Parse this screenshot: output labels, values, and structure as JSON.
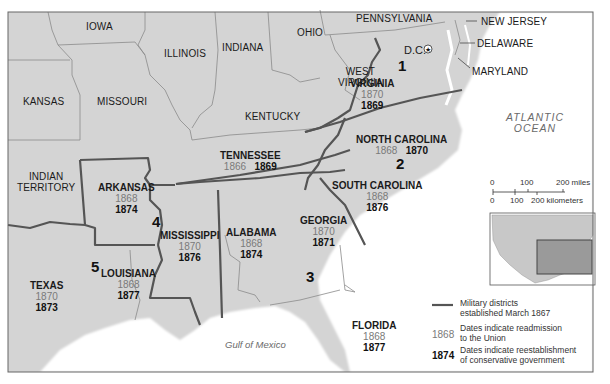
{
  "map": {
    "ocean_label": [
      "ATLANTIC",
      "OCEAN"
    ],
    "gulf_label": "Gulf of Mexico",
    "colors": {
      "land": "#d4d4d4",
      "water": "#ffffff",
      "district_border": "#555555",
      "state_border": "#8a8a8a",
      "readmission_text": "#7a7a7a",
      "reestablishment_text": "#111111"
    },
    "other_states": {
      "iowa": "IOWA",
      "illinois": "ILLINOIS",
      "indiana": "INDIANA",
      "ohio": "OHIO",
      "pennsylvania": "PENNSYLVANIA",
      "new_jersey": "NEW JERSEY",
      "delaware": "DELAWARE",
      "maryland": "MARYLAND",
      "dc": "D.C.",
      "west_virginia": [
        "WEST",
        "VIRGINIA"
      ],
      "kansas": "KANSAS",
      "missouri": "MISSOURI",
      "kentucky": "KENTUCKY",
      "indian_territory": [
        "INDIAN",
        "TERRITORY"
      ]
    },
    "confederate_states": {
      "virginia": {
        "name": "VIRGINIA",
        "readmission": "1870",
        "reestablishment": "1869"
      },
      "north_carolina": {
        "name": "NORTH CAROLINA",
        "readmission": "1868",
        "reestablishment": "1870"
      },
      "south_carolina": {
        "name": "SOUTH CAROLINA",
        "readmission": "1868",
        "reestablishment": "1876"
      },
      "tennessee": {
        "name": "TENNESSEE",
        "readmission": "1866",
        "reestablishment": "1869"
      },
      "georgia": {
        "name": "GEORGIA",
        "readmission": "1870",
        "reestablishment": "1871"
      },
      "alabama": {
        "name": "ALABAMA",
        "readmission": "1868",
        "reestablishment": "1874"
      },
      "mississippi": {
        "name": "MISSISSIPPI",
        "readmission": "1870",
        "reestablishment": "1876"
      },
      "arkansas": {
        "name": "ARKANSAS",
        "readmission": "1868",
        "reestablishment": "1874"
      },
      "louisiana": {
        "name": "LOUISIANA",
        "readmission": "1868",
        "reestablishment": "1877"
      },
      "texas": {
        "name": "TEXAS",
        "readmission": "1870",
        "reestablishment": "1873"
      },
      "florida": {
        "name": "FLORIDA",
        "readmission": "1868",
        "reestablishment": "1877"
      }
    },
    "military_districts": [
      "1",
      "2",
      "3",
      "4",
      "5"
    ]
  },
  "scale": {
    "miles": [
      "0",
      "100",
      "200 miles"
    ],
    "kilometers": [
      "0",
      "100",
      "200 kilometers"
    ]
  },
  "legend": {
    "districts_line": [
      "Military districts",
      "established March 1867"
    ],
    "readmission_key": "1868",
    "readmission_text": [
      "Dates indicate readmission",
      "to the Union"
    ],
    "reestablishment_key": "1874",
    "reestablishment_text": [
      "Dates indicate reestablishment",
      "of conservative government"
    ]
  }
}
